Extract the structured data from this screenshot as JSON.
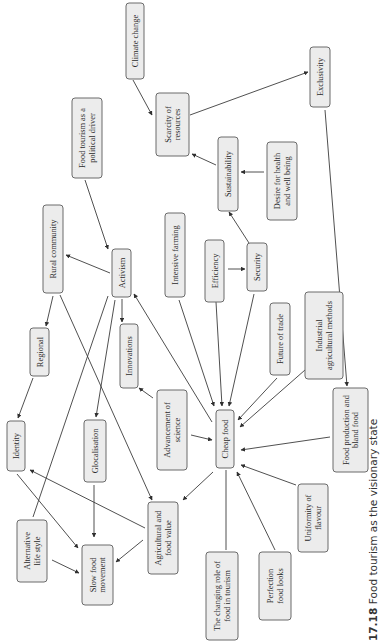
{
  "diagram": {
    "orientation": "rotated-90-ccw",
    "caption": {
      "number": "17.18",
      "text": "Food tourism as the visionary state"
    },
    "nodes": [
      {
        "id": "climate",
        "label": [
          "Climate change"
        ],
        "x": 126,
        "y": 3,
        "w": 18,
        "h": 76
      },
      {
        "id": "scarcity",
        "label": [
          "Scarcity of",
          "resources"
        ],
        "x": 156,
        "y": 93,
        "w": 33,
        "h": 63
      },
      {
        "id": "exclusivity",
        "label": [
          "Exclusivity"
        ],
        "x": 310,
        "y": 47,
        "w": 20,
        "h": 60
      },
      {
        "id": "political",
        "label": [
          "Food tourism as a",
          "political driver"
        ],
        "x": 72,
        "y": 98,
        "w": 30,
        "h": 80
      },
      {
        "id": "sustainability",
        "label": [
          "Sustainability"
        ],
        "x": 218,
        "y": 137,
        "w": 20,
        "h": 74
      },
      {
        "id": "health",
        "label": [
          "Desire for health",
          "and well being"
        ],
        "x": 267,
        "y": 142,
        "w": 30,
        "h": 78
      },
      {
        "id": "rural",
        "label": [
          "Rural community"
        ],
        "x": 43,
        "y": 205,
        "w": 20,
        "h": 88
      },
      {
        "id": "activism",
        "label": [
          "Activism"
        ],
        "x": 112,
        "y": 249,
        "w": 19,
        "h": 48
      },
      {
        "id": "intensive",
        "label": [
          "Intensive farming"
        ],
        "x": 165,
        "y": 213,
        "w": 20,
        "h": 84
      },
      {
        "id": "efficiency",
        "label": [
          "Efficiency"
        ],
        "x": 205,
        "y": 240,
        "w": 19,
        "h": 62
      },
      {
        "id": "security",
        "label": [
          "Security"
        ],
        "x": 247,
        "y": 243,
        "w": 20,
        "h": 48
      },
      {
        "id": "trade",
        "label": [
          "Future of trade"
        ],
        "x": 270,
        "y": 303,
        "w": 20,
        "h": 72
      },
      {
        "id": "industrial",
        "label": [
          "Industrial",
          "agricultural methods"
        ],
        "x": 305,
        "y": 292,
        "w": 38,
        "h": 87
      },
      {
        "id": "regional",
        "label": [
          "Regional"
        ],
        "x": 30,
        "y": 328,
        "w": 19,
        "h": 48
      },
      {
        "id": "innovations",
        "label": [
          "Innovations"
        ],
        "x": 120,
        "y": 324,
        "w": 18,
        "h": 64
      },
      {
        "id": "identity",
        "label": [
          "Identity"
        ],
        "x": 7,
        "y": 421,
        "w": 18,
        "h": 50
      },
      {
        "id": "glocal",
        "label": [
          "Glocalisation"
        ],
        "x": 84,
        "y": 420,
        "w": 22,
        "h": 62
      },
      {
        "id": "science",
        "label": [
          "Advancement of",
          "science"
        ],
        "x": 157,
        "y": 390,
        "w": 30,
        "h": 80
      },
      {
        "id": "cheap",
        "label": [
          "Cheap food"
        ],
        "x": 216,
        "y": 410,
        "w": 18,
        "h": 58
      },
      {
        "id": "bland",
        "label": [
          "Food production and",
          "bland food"
        ],
        "x": 333,
        "y": 388,
        "w": 35,
        "h": 84
      },
      {
        "id": "agrivalue",
        "label": [
          "Agricultural and",
          "food value"
        ],
        "x": 148,
        "y": 502,
        "w": 30,
        "h": 72
      },
      {
        "id": "altlife",
        "label": [
          "Alternative",
          "life style"
        ],
        "x": 17,
        "y": 520,
        "w": 30,
        "h": 62
      },
      {
        "id": "slowfood",
        "label": [
          "Slow food",
          "movement"
        ],
        "x": 82,
        "y": 545,
        "w": 31,
        "h": 60
      },
      {
        "id": "uniformity",
        "label": [
          "Uniformity of",
          "flavour"
        ],
        "x": 298,
        "y": 484,
        "w": 30,
        "h": 68
      },
      {
        "id": "perfection",
        "label": [
          "Perfection",
          "food looks"
        ],
        "x": 259,
        "y": 552,
        "w": 32,
        "h": 68
      },
      {
        "id": "changing",
        "label": [
          "The changing role of",
          "food in tourism"
        ],
        "x": 206,
        "y": 552,
        "w": 32,
        "h": 88
      }
    ],
    "edges": [
      {
        "from": [
          133,
          80
        ],
        "to": [
          152,
          115
        ],
        "arrow": true
      },
      {
        "from": [
          190,
          115
        ],
        "to": [
          308,
          72
        ],
        "arrow": true
      },
      {
        "from": [
          216,
          165
        ],
        "to": [
          192,
          154
        ],
        "arrow": true
      },
      {
        "from": [
          264,
          172
        ],
        "to": [
          241,
          172
        ],
        "arrow": true
      },
      {
        "from": [
          249,
          243
        ],
        "to": [
          229,
          212
        ],
        "arrow": true
      },
      {
        "from": [
          228,
          269
        ],
        "to": [
          245,
          269
        ],
        "arrow": true
      },
      {
        "from": [
          85,
          180
        ],
        "to": [
          108,
          249
        ],
        "arrow": true
      },
      {
        "from": [
          110,
          273
        ],
        "to": [
          66,
          255
        ],
        "arrow": true
      },
      {
        "from": [
          122,
          299
        ],
        "to": [
          122,
          322
        ],
        "arrow": true
      },
      {
        "from": [
          53,
          296
        ],
        "to": [
          46,
          326
        ],
        "arrow": true
      },
      {
        "from": [
          33,
          378
        ],
        "to": [
          18,
          418
        ],
        "arrow": true
      },
      {
        "from": [
          108,
          296
        ],
        "to": [
          33,
          517
        ],
        "arrow": false
      },
      {
        "from": [
          115,
          300
        ],
        "to": [
          96,
          417
        ],
        "arrow": true
      },
      {
        "from": [
          60,
          295
        ],
        "to": [
          152,
          500
        ],
        "arrow": true
      },
      {
        "from": [
          17,
          474
        ],
        "to": [
          78,
          548
        ],
        "arrow": true
      },
      {
        "from": [
          94,
          485
        ],
        "to": [
          94,
          537
        ],
        "arrow": true
      },
      {
        "from": [
          52,
          560
        ],
        "to": [
          79,
          573
        ],
        "arrow": true
      },
      {
        "from": [
          143,
          540
        ],
        "to": [
          116,
          562
        ],
        "arrow": true
      },
      {
        "from": [
          145,
          528
        ],
        "to": [
          30,
          470
        ],
        "arrow": true
      },
      {
        "from": [
          153,
          398
        ],
        "to": [
          139,
          388
        ],
        "arrow": true
      },
      {
        "from": [
          191,
          435
        ],
        "to": [
          212,
          440
        ],
        "arrow": true
      },
      {
        "from": [
          212,
          422
        ],
        "to": [
          134,
          294
        ],
        "arrow": true
      },
      {
        "from": [
          213,
          472
        ],
        "to": [
          183,
          500
        ],
        "arrow": true
      },
      {
        "from": [
          179,
          300
        ],
        "to": [
          214,
          406
        ],
        "arrow": true
      },
      {
        "from": [
          216,
          302
        ],
        "to": [
          222,
          406
        ],
        "arrow": true
      },
      {
        "from": [
          254,
          294
        ],
        "to": [
          229,
          406
        ],
        "arrow": true
      },
      {
        "from": [
          277,
          378
        ],
        "to": [
          238,
          420
        ],
        "arrow": true
      },
      {
        "from": [
          305,
          370
        ],
        "to": [
          240,
          427
        ],
        "arrow": true
      },
      {
        "from": [
          330,
          437
        ],
        "to": [
          241,
          450
        ],
        "arrow": true
      },
      {
        "from": [
          296,
          485
        ],
        "to": [
          241,
          465
        ],
        "arrow": true
      },
      {
        "from": [
          275,
          550
        ],
        "to": [
          237,
          472
        ],
        "arrow": true
      },
      {
        "from": [
          226,
          550
        ],
        "to": [
          226,
          470
        ],
        "arrow": false
      },
      {
        "from": [
          325,
          110
        ],
        "to": [
          347,
          386
        ],
        "arrow": true
      }
    ]
  }
}
